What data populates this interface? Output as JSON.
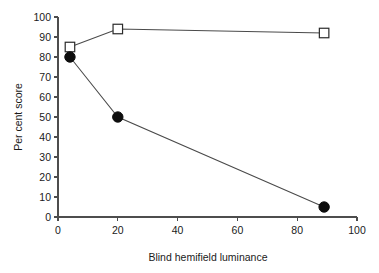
{
  "chart_data": {
    "type": "line",
    "title": "",
    "xlabel": "Blind hemifield luminance",
    "ylabel": "Per cent score",
    "xlim": [
      0,
      100
    ],
    "ylim": [
      0,
      100
    ],
    "xticks": [
      0,
      20,
      40,
      60,
      80,
      100
    ],
    "yticks": [
      0,
      10,
      20,
      30,
      40,
      50,
      60,
      70,
      80,
      90,
      100
    ],
    "xtick_labels": [
      "0",
      "20",
      "40",
      "60",
      "80",
      "100"
    ],
    "ytick_labels": [
      "0",
      "10",
      "20",
      "30",
      "40",
      "50",
      "60",
      "70",
      "80",
      "90",
      "100"
    ],
    "grid": false,
    "legend": false,
    "legend_position": "none",
    "series": [
      {
        "name": "open-square-series",
        "marker": "open-square",
        "color": "#2b2b2b",
        "x": [
          4,
          20,
          89
        ],
        "y": [
          85,
          94,
          92
        ]
      },
      {
        "name": "filled-circle-series",
        "marker": "filled-circle",
        "color": "#0d0d0d",
        "x": [
          4,
          20,
          89
        ],
        "y": [
          80,
          50,
          5
        ]
      }
    ]
  },
  "figure": {
    "background_color": "#ffffff",
    "axis_color": "#4d4d4d",
    "line_color": "#4a4a4a"
  },
  "caption": {
    "clipped_text": ""
  }
}
